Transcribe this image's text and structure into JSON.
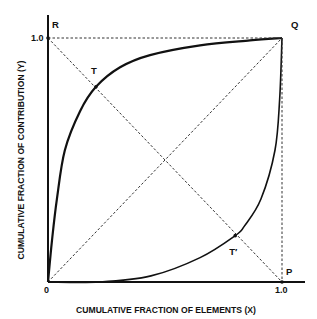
{
  "chart_data": {
    "type": "line",
    "title": "",
    "xlabel": "CUMULATIVE FRACTION OF ELEMENTS (X)",
    "ylabel": "CUMULATIVE FRACTION OF CONTRIBUTION (Y)",
    "xlim": [
      0,
      1.0
    ],
    "ylim": [
      0,
      1.0
    ],
    "grid": false,
    "legend": null,
    "x_tick_labels": [
      "0",
      "1.0"
    ],
    "y_tick_labels": [
      "1.0"
    ],
    "series": [
      {
        "name": "upper-curve",
        "style": "solid-thick",
        "points": [
          [
            0,
            0
          ],
          [
            0.017,
            0.17
          ],
          [
            0.038,
            0.34
          ],
          [
            0.072,
            0.54
          ],
          [
            0.137,
            0.7
          ],
          [
            0.205,
            0.8
          ],
          [
            0.308,
            0.88
          ],
          [
            0.436,
            0.93
          ],
          [
            0.65,
            0.97
          ],
          [
            0.863,
            0.99
          ],
          [
            1.0,
            1.0
          ]
        ]
      },
      {
        "name": "lower-curve",
        "style": "solid",
        "points": [
          [
            0,
            0
          ],
          [
            0.22,
            0.0
          ],
          [
            0.44,
            0.025
          ],
          [
            0.65,
            0.1
          ],
          [
            0.8,
            0.19
          ],
          [
            0.84,
            0.23
          ],
          [
            0.91,
            0.34
          ],
          [
            0.97,
            0.54
          ],
          [
            0.99,
            0.75
          ],
          [
            1.0,
            1.0
          ]
        ]
      },
      {
        "name": "diagonal-OQ",
        "style": "dashed",
        "points": [
          [
            0,
            0
          ],
          [
            1.0,
            1.0
          ]
        ]
      },
      {
        "name": "diagonal-RP",
        "style": "dashed",
        "points": [
          [
            0,
            1.0
          ],
          [
            1.0,
            0
          ]
        ]
      },
      {
        "name": "line-RQ",
        "style": "dashed",
        "points": [
          [
            0,
            1.0
          ],
          [
            1.0,
            1.0
          ]
        ]
      },
      {
        "name": "line-QP",
        "style": "dashed",
        "points": [
          [
            1.0,
            1.0
          ],
          [
            1.0,
            0
          ]
        ]
      }
    ],
    "annotations": [
      {
        "label": "R",
        "x": 0,
        "y": 1.0,
        "dx": 4,
        "dy": -10
      },
      {
        "label": "Q",
        "x": 1.0,
        "y": 1.0,
        "dx": 9,
        "dy": -10
      },
      {
        "label": "T",
        "x": 0.205,
        "y": 0.8,
        "dx": -5,
        "dy": -13
      },
      {
        "label": "T′",
        "x": 0.8,
        "y": 0.19,
        "dx": -6,
        "dy": 19
      },
      {
        "label": "P",
        "x": 1.0,
        "y": 0,
        "dx": 4,
        "dy": -7
      }
    ],
    "marked_points": [
      {
        "name": "T",
        "x": 0.205,
        "y": 0.8
      },
      {
        "name": "T-prime",
        "x": 0.8,
        "y": 0.19
      },
      {
        "name": "R",
        "x": 0,
        "y": 1.0
      },
      {
        "name": "P",
        "x": 1.0,
        "y": 0
      }
    ]
  },
  "layout": {
    "origin_px": [
      48,
      282
    ],
    "x1_px": 282,
    "y1_px": 38,
    "x_axis_end_px": 305,
    "y_axis_top_px": 15
  },
  "colors": {
    "ink": "#111111",
    "dash": "#333333",
    "background": "#ffffff"
  }
}
